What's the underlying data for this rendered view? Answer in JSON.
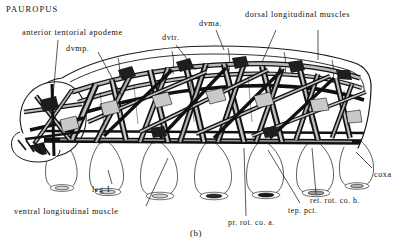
{
  "figure": {
    "taxon": "PAUROPUS",
    "caption": "(b)"
  },
  "labels": {
    "anterior_tentorial_apodeme": "anterior tentorial apodeme",
    "dvmp": "dvmp.",
    "dvtr": "dvtr.",
    "dvma": "dvma.",
    "dorsal_longitudinal_muscles": "dorsal longitudinal muscles",
    "coxa": "coxa",
    "ret_rot_co_b": "ret. rot. co. b.",
    "tep_pct": "tep. pct.",
    "pr_rot_co_a": "pr. rot. co. a.",
    "leg_1": "leg 1",
    "ventral_longitudinal_muscle": "ventral longitudinal muscle"
  },
  "colors": {
    "ink": "#111111",
    "paper": "#ffffff",
    "muscle_fill": "#b9b9b9",
    "outline": "#1a1a1a"
  }
}
